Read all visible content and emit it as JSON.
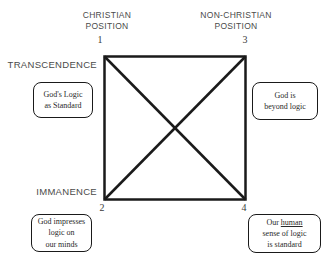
{
  "colors": {
    "background": "#ffffff",
    "line": "#1a1a1a",
    "header_text": "#4a4a4a",
    "box_border": "#1a1a1a",
    "box_text": "#2a2a2a"
  },
  "headers": {
    "christian": {
      "line1": "CHRISTIAN",
      "line2": "POSITION"
    },
    "non_christian": {
      "line1": "NON-CHRISTIAN",
      "line2": "POSITION"
    }
  },
  "axes": {
    "transcendence": "TRANSCENDENCE",
    "immanence": "IMMANENCE"
  },
  "corners": {
    "one": "1",
    "two": "2",
    "three": "3",
    "four": "4"
  },
  "boxes": {
    "top_left": {
      "line1": "God's Logic",
      "line2": "as Standard"
    },
    "top_right": {
      "line1": "God is",
      "line2": "beyond logic"
    },
    "bottom_left": {
      "line1": "God impresses",
      "line2": "logic on",
      "line3": "our minds"
    },
    "bottom_right": {
      "line1_prefix": "Our ",
      "line1_underlined": "human",
      "line2": "sense of logic",
      "line3": "is standard"
    }
  }
}
